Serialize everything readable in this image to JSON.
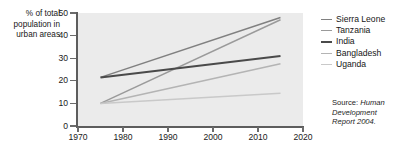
{
  "axis": {
    "ylabel": "% of total population in urban areas",
    "yticks": [
      "0",
      "10",
      "20",
      "30",
      "40",
      "50"
    ],
    "xticks": [
      "1970",
      "1980",
      "1990",
      "2000",
      "2010",
      "2020"
    ]
  },
  "legend": {
    "items": [
      {
        "label": "Sierra Leone",
        "color": "#808080"
      },
      {
        "label": "Tanzania",
        "color": "#9a9a9a"
      },
      {
        "label": "India",
        "color": "#4a4a4a"
      },
      {
        "label": "Bangladesh",
        "color": "#b4b4b4"
      },
      {
        "label": "Uganda",
        "color": "#c9c9c9"
      }
    ]
  },
  "source": {
    "prefix": "Source: ",
    "title": "Human Development Report 2004."
  },
  "chart_data": {
    "type": "line",
    "title": "",
    "xlabel": "",
    "ylabel": "% of total population in urban areas",
    "xlim": [
      1970,
      2020
    ],
    "ylim": [
      0,
      50
    ],
    "grid": false,
    "legend_position": "right",
    "plot_background": "#ebebeb",
    "x": [
      1975,
      2015
    ],
    "series": [
      {
        "name": "Sierra Leone",
        "color": "#808080",
        "width": 1.5,
        "values": [
          21.5,
          48.0
        ]
      },
      {
        "name": "Tanzania",
        "color": "#9a9a9a",
        "width": 1.5,
        "values": [
          10.0,
          47.0
        ]
      },
      {
        "name": "India",
        "color": "#4a4a4a",
        "width": 2.0,
        "values": [
          21.5,
          31.0
        ]
      },
      {
        "name": "Bangladesh",
        "color": "#b4b4b4",
        "width": 1.5,
        "values": [
          10.0,
          27.5
        ]
      },
      {
        "name": "Uganda",
        "color": "#c9c9c9",
        "width": 1.5,
        "values": [
          10.0,
          14.5
        ]
      }
    ]
  }
}
